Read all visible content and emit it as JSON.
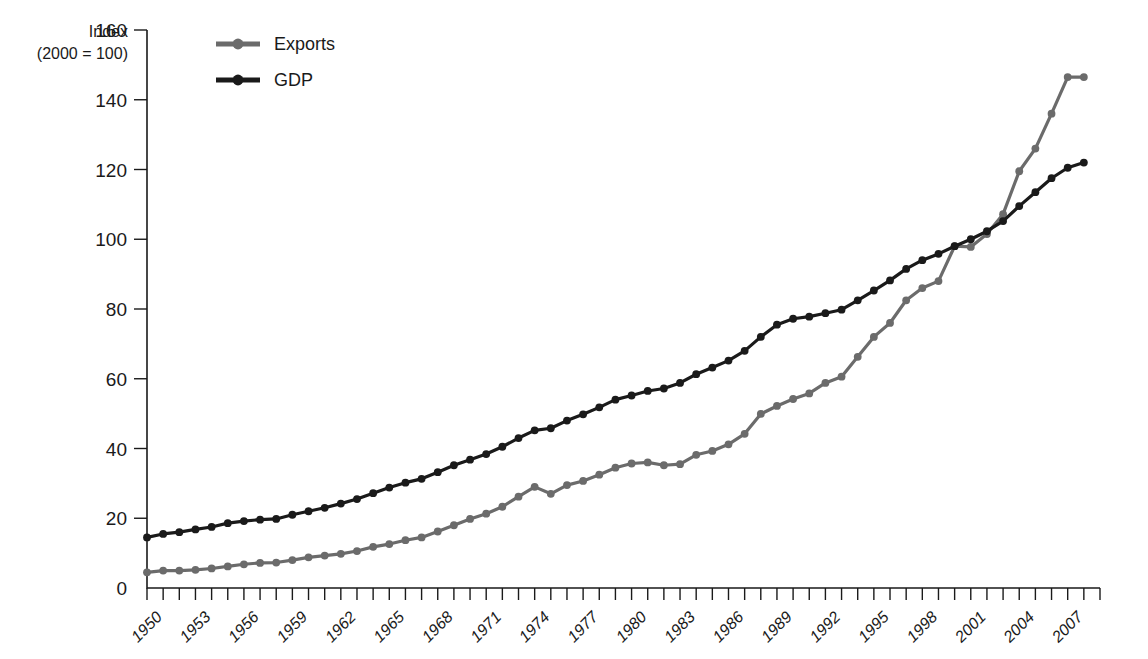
{
  "chart_data": {
    "type": "line",
    "title": "",
    "subtitle": "",
    "ylabel_line1": "Index",
    "ylabel_line2": "(2000 = 100)",
    "xlabel": "",
    "ylim": [
      0,
      160
    ],
    "yticks": [
      0,
      20,
      40,
      60,
      80,
      100,
      120,
      140,
      160
    ],
    "xlim": [
      1950,
      2009
    ],
    "xticks": [
      1950,
      1953,
      1956,
      1959,
      1962,
      1965,
      1968,
      1971,
      1974,
      1977,
      1980,
      1983,
      1986,
      1989,
      1992,
      1995,
      1998,
      2001,
      2004,
      2007
    ],
    "xtick_labels": [
      "1950",
      "1953",
      "1956",
      "1959",
      "1962",
      "1965",
      "1968",
      "1971",
      "1974",
      "1977",
      "1980",
      "1983",
      "1986",
      "1989",
      "1992",
      "1995",
      "1998",
      "2001",
      "2004",
      "2007"
    ],
    "grid": false,
    "legend_position": "top-left-inside",
    "x": [
      1950,
      1951,
      1952,
      1953,
      1954,
      1955,
      1956,
      1957,
      1958,
      1959,
      1960,
      1961,
      1962,
      1963,
      1964,
      1965,
      1966,
      1967,
      1968,
      1969,
      1970,
      1971,
      1972,
      1973,
      1974,
      1975,
      1976,
      1977,
      1978,
      1979,
      1980,
      1981,
      1982,
      1983,
      1984,
      1985,
      1986,
      1987,
      1988,
      1989,
      1990,
      1991,
      1992,
      1993,
      1994,
      1995,
      1996,
      1997,
      1998,
      1999,
      2000,
      2001,
      2002,
      2003,
      2004,
      2005,
      2006,
      2007,
      2008
    ],
    "series": [
      {
        "name": "Exports",
        "color": "#6b6b6b",
        "marker": "circle",
        "values": [
          4.5,
          5.0,
          5.0,
          5.2,
          5.6,
          6.2,
          6.8,
          7.2,
          7.3,
          8.0,
          8.8,
          9.3,
          9.8,
          10.6,
          11.8,
          12.6,
          13.7,
          14.5,
          16.2,
          18.0,
          19.8,
          21.3,
          23.3,
          26.2,
          29.0,
          27.0,
          29.5,
          30.7,
          32.5,
          34.5,
          35.7,
          36.0,
          35.2,
          35.5,
          38.2,
          39.3,
          41.2,
          44.2,
          49.9,
          52.2,
          54.2,
          55.8,
          58.8,
          60.6,
          66.3,
          72.0,
          76.0,
          82.5,
          86.0,
          88.0,
          98.0,
          97.8,
          101.5,
          107.2,
          119.5,
          126.0,
          136.0,
          146.5,
          146.5
        ]
      },
      {
        "name": "GDP",
        "color": "#1a1a1a",
        "marker": "circle",
        "values": [
          14.5,
          15.5,
          16.0,
          16.8,
          17.5,
          18.6,
          19.2,
          19.6,
          19.8,
          21.0,
          22.0,
          23.0,
          24.2,
          25.5,
          27.2,
          28.8,
          30.2,
          31.3,
          33.2,
          35.2,
          36.8,
          38.4,
          40.5,
          43.0,
          45.2,
          45.8,
          48.0,
          49.8,
          51.8,
          54.0,
          55.2,
          56.5,
          57.2,
          58.8,
          61.3,
          63.2,
          65.2,
          68.0,
          72.0,
          75.5,
          77.2,
          77.8,
          78.8,
          79.8,
          82.5,
          85.3,
          88.2,
          91.5,
          94.0,
          95.8,
          98.0,
          100.0,
          102.3,
          105.2,
          109.5,
          113.5,
          117.5,
          120.5,
          122.0
        ]
      }
    ]
  },
  "legend": {
    "items": [
      {
        "label": "Exports",
        "color": "#6b6b6b"
      },
      {
        "label": "GDP",
        "color": "#1a1a1a"
      }
    ]
  }
}
